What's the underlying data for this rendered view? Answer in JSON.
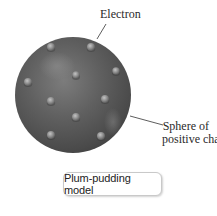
{
  "diagram": {
    "title": "Plum-pudding model",
    "labels": {
      "electron": "Electron",
      "sphere_line1": "Sphere of",
      "sphere_line2": "positive charge"
    },
    "sphere": {
      "cx": 73,
      "cy": 95,
      "r": 58,
      "color": "#5a5a5a",
      "highlight_color": "#8a8a8a",
      "shadow_color": "#3a3a3a"
    },
    "electrons": [
      {
        "x": 51,
        "y": 47
      },
      {
        "x": 91,
        "y": 47
      },
      {
        "x": 28,
        "y": 82
      },
      {
        "x": 116,
        "y": 71
      },
      {
        "x": 76,
        "y": 75
      },
      {
        "x": 51,
        "y": 101
      },
      {
        "x": 105,
        "y": 99
      },
      {
        "x": 76,
        "y": 117
      },
      {
        "x": 51,
        "y": 135
      },
      {
        "x": 101,
        "y": 136
      }
    ],
    "electron_color": "#9a9a9a",
    "leader_lines": {
      "electron": {
        "x1": 97,
        "y1": 39,
        "x2": 106,
        "y2": 24
      },
      "sphere": {
        "x1": 130,
        "y1": 116,
        "x2": 163,
        "y2": 125
      }
    }
  }
}
